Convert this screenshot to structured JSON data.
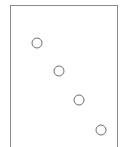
{
  "figure": {
    "width": 124,
    "height": 147,
    "background_color": "#ffffff"
  },
  "panel": {
    "name": "plot-panel",
    "border_color": "#8a8a8a",
    "border_width": 1,
    "fill_color": "#ffffff",
    "x": 10.5,
    "y": 5.5,
    "width": 107,
    "height": 148,
    "bottom_clipped": true
  },
  "chart_data": {
    "type": "scatter",
    "title": "",
    "subtitle": "",
    "xlabel": "",
    "ylabel": "",
    "grid": false,
    "legend": null,
    "axis_ticks_visible": false,
    "axis_labels_visible": false,
    "marker": {
      "shape": "circle",
      "filled": false,
      "fill_color": "#ffffff",
      "stroke_color": "#6f6f6f",
      "stroke_width": 1,
      "radius": 5
    },
    "xlim": [
      10.5,
      117.5
    ],
    "ylim": [
      5.5,
      153.5
    ],
    "points": [
      {
        "label": "point-1",
        "cx": 37,
        "cy": 43,
        "r": 5
      },
      {
        "label": "point-2",
        "cx": 59,
        "cy": 71,
        "r": 5
      },
      {
        "label": "point-3",
        "cx": 79,
        "cy": 100,
        "r": 5
      },
      {
        "label": "point-4",
        "cx": 101,
        "cy": 130,
        "r": 5
      }
    ],
    "annotations": []
  }
}
